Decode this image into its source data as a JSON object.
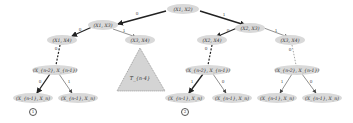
{
  "diagram": {
    "type": "binary-tree",
    "node_fill": "#d9d9d9",
    "edge_color": "#222222",
    "nodes": {
      "root": "(X1, X2)",
      "l": "(X1, X3)",
      "ll": "(X1, X4)",
      "lr": "(X3, X4)",
      "lldeep": "(X_{n-2}, X_{n-1})",
      "lll": "(X_{n-1}, X_n)",
      "llr": "(X_{n-1}, X_n)",
      "r": "(X2, X3)",
      "rl": "(X2, X4)",
      "rr": "(X3, X4)",
      "rldeep": "(X_{n-2}, X_{n-1})",
      "rll": "(X_{n-1}, X_n)",
      "rlr": "(X_{n-1}, X_n)",
      "rrdeep": "(X_{n-2}, X_{n-1})",
      "rrl": "(X_{n-1}, X_n)",
      "rrr": "(X_{n-1}, X_n)"
    },
    "edge_labels": {
      "root_l": "0",
      "root_r": "1",
      "l_ll": "0",
      "l_lr": "1",
      "ll_down": "0",
      "lldeep_lll": "0",
      "lldeep_llr": "1",
      "r_rl": "0",
      "r_rr": "1",
      "rl_down": "0",
      "rr_down": "0",
      "rldeep_rll": "1",
      "rldeep_rlr": "0",
      "rrdeep_rrl": "1",
      "rrdeep_rrr": "0"
    },
    "subtree_label": "T_{n-4}",
    "leaf_markers": [
      "1",
      "2"
    ]
  }
}
